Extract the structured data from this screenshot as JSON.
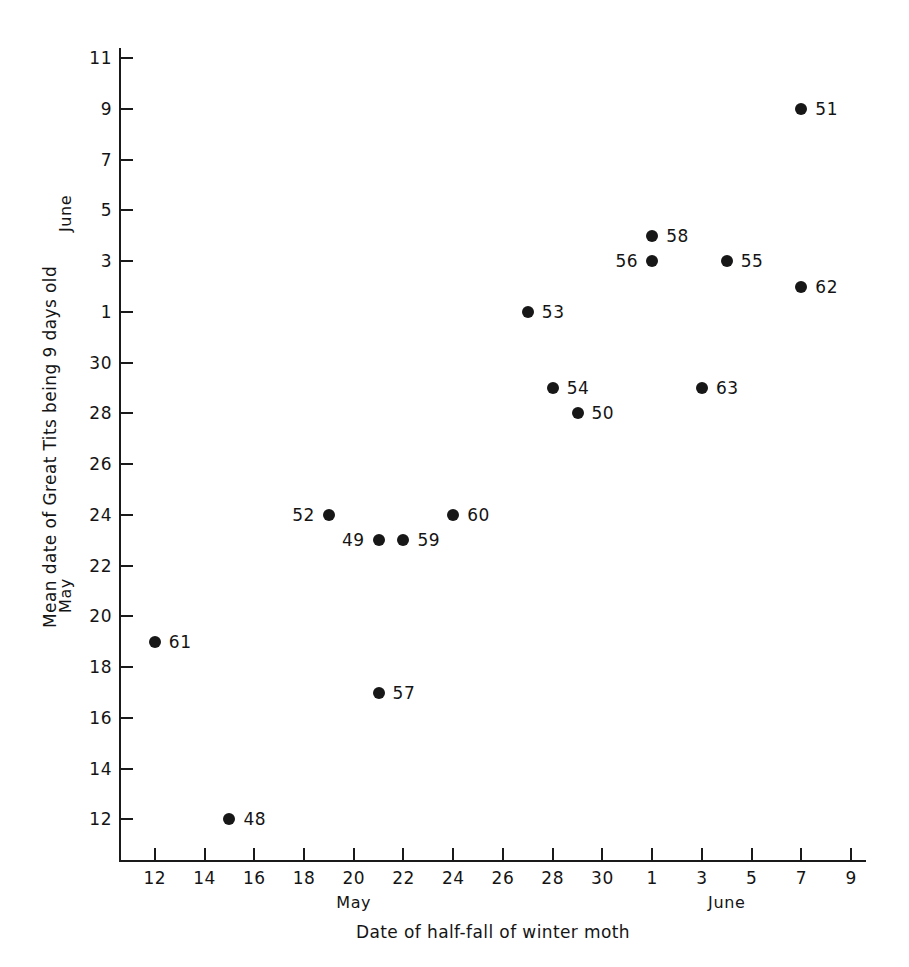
{
  "figure": {
    "background_color": "#ffffff",
    "ink_color": "#171717"
  },
  "chart_data": {
    "type": "scatter",
    "title": "",
    "xlabel": "Date of half-fall of winter moth",
    "ylabel": "Mean date of Great Tits being 9 days old",
    "x_month_labels": [
      {
        "text": "May",
        "value": 20
      },
      {
        "text": "June",
        "value": 35
      }
    ],
    "y_month_labels": [
      {
        "text": "June",
        "value": 36
      },
      {
        "text": "May",
        "value": 21
      }
    ],
    "x_ticks": [
      {
        "label": "12",
        "value": 12
      },
      {
        "label": "14",
        "value": 14
      },
      {
        "label": "16",
        "value": 16
      },
      {
        "label": "18",
        "value": 18
      },
      {
        "label": "20",
        "value": 20
      },
      {
        "label": "22",
        "value": 22
      },
      {
        "label": "24",
        "value": 24
      },
      {
        "label": "26",
        "value": 26
      },
      {
        "label": "28",
        "value": 28
      },
      {
        "label": "30",
        "value": 30
      },
      {
        "label": "1",
        "value": 32
      },
      {
        "label": "3",
        "value": 34
      },
      {
        "label": "5",
        "value": 36
      },
      {
        "label": "7",
        "value": 38
      },
      {
        "label": "9",
        "value": 40
      }
    ],
    "y_ticks": [
      {
        "label": "12",
        "value": 12
      },
      {
        "label": "14",
        "value": 14
      },
      {
        "label": "16",
        "value": 16
      },
      {
        "label": "18",
        "value": 18
      },
      {
        "label": "20",
        "value": 20
      },
      {
        "label": "22",
        "value": 22
      },
      {
        "label": "24",
        "value": 24
      },
      {
        "label": "26",
        "value": 26
      },
      {
        "label": "28",
        "value": 28
      },
      {
        "label": "30",
        "value": 30
      },
      {
        "label": "1",
        "value": 32
      },
      {
        "label": "3",
        "value": 34
      },
      {
        "label": "5",
        "value": 36
      },
      {
        "label": "7",
        "value": 38
      },
      {
        "label": "9",
        "value": 40
      },
      {
        "label": "11",
        "value": 42
      }
    ],
    "xlim": [
      10.6,
      40.6
    ],
    "ylim": [
      10.4,
      42.4
    ],
    "grid": false,
    "legend": null,
    "points": [
      {
        "label": "61",
        "x": 12,
        "y": 19,
        "label_side": "right"
      },
      {
        "label": "48",
        "x": 15,
        "y": 12,
        "label_side": "right"
      },
      {
        "label": "52",
        "x": 19,
        "y": 24,
        "label_side": "left"
      },
      {
        "label": "57",
        "x": 21,
        "y": 17,
        "label_side": "right"
      },
      {
        "label": "49",
        "x": 21,
        "y": 23,
        "label_side": "left"
      },
      {
        "label": "59",
        "x": 22,
        "y": 23,
        "label_side": "right"
      },
      {
        "label": "60",
        "x": 24,
        "y": 24,
        "label_side": "right"
      },
      {
        "label": "53",
        "x": 27,
        "y": 32,
        "label_side": "right"
      },
      {
        "label": "54",
        "x": 28,
        "y": 29,
        "label_side": "right"
      },
      {
        "label": "50",
        "x": 29,
        "y": 28,
        "label_side": "right"
      },
      {
        "label": "63",
        "x": 34,
        "y": 29,
        "label_side": "right"
      },
      {
        "label": "56",
        "x": 32,
        "y": 34,
        "label_side": "left"
      },
      {
        "label": "58",
        "x": 32,
        "y": 35,
        "label_side": "right"
      },
      {
        "label": "55",
        "x": 35,
        "y": 34,
        "label_side": "right"
      },
      {
        "label": "62",
        "x": 38,
        "y": 33,
        "label_side": "right"
      },
      {
        "label": "51",
        "x": 38,
        "y": 40,
        "label_side": "right"
      }
    ]
  }
}
